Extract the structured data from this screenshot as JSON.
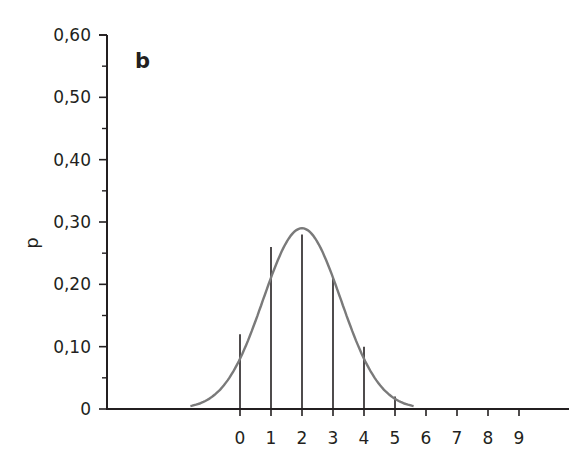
{
  "chart_data": {
    "type": "bar",
    "subtype": "stem-with-curve",
    "title": "",
    "panel_label": "b",
    "xlabel": "",
    "ylabel": "p",
    "categories": [
      "0",
      "1",
      "2",
      "3",
      "4",
      "5",
      "6",
      "7",
      "8",
      "9"
    ],
    "series": [
      {
        "name": "probability",
        "style": "vertical-lines",
        "values": [
          0.12,
          0.26,
          0.28,
          0.21,
          0.1,
          0.02,
          0,
          0,
          0,
          0
        ]
      },
      {
        "name": "normal-approximation",
        "style": "smooth-curve",
        "peak_x": 2,
        "peak_y": 0.29,
        "x_range": [
          -1.6,
          5.6
        ]
      }
    ],
    "y_ticks": [
      "0",
      "0,10",
      "0,20",
      "0,30",
      "0,40",
      "0,50",
      "0,60"
    ],
    "y_tick_values": [
      0,
      0.1,
      0.2,
      0.3,
      0.4,
      0.5,
      0.6
    ],
    "x_ticks": [
      "0",
      "1",
      "2",
      "3",
      "4",
      "5",
      "6",
      "7",
      "8",
      "9"
    ],
    "ylim": [
      0,
      0.6
    ],
    "xlim": [
      -4.3,
      10.3
    ],
    "grid": false,
    "legend": null,
    "colors": {
      "axis": "#231f20",
      "stems": "#231f20",
      "curve": "#7a7a7a"
    }
  }
}
